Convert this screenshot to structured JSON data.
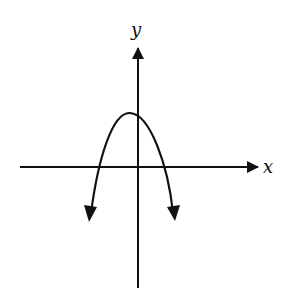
{
  "figure": {
    "x_axis_label": "x",
    "y_axis_label": "y",
    "curve": {
      "type": "parabola",
      "opens": "down",
      "vertex_position": "left of y-axis, above x-axis",
      "x_intercepts": "one negative, one positive",
      "y_intercept": "positive",
      "ends": "arrows pointing downward"
    },
    "colors": {
      "ink": "#111111",
      "background": "#ffffff"
    }
  }
}
